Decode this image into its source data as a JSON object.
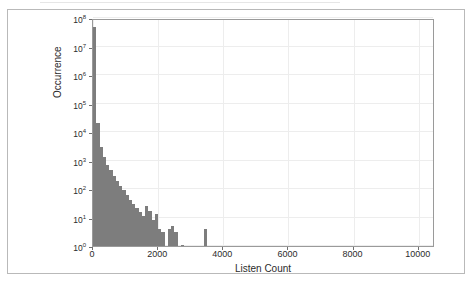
{
  "figure": {
    "background_color": "#ffffff",
    "frame_color": "#b9b9b9",
    "axis_color": "#9a9a9a",
    "grid_color": "#ededed",
    "bar_color": "#7d7d7d",
    "text_color": "#2b2b2b"
  },
  "chart_data": {
    "type": "bar",
    "title": "",
    "xlabel": "Listen Count",
    "ylabel": "Occurrence",
    "xlim": [
      0,
      10500
    ],
    "ylim": [
      1,
      100000000
    ],
    "yscale": "log",
    "xscale": "linear",
    "grid": true,
    "legend": null,
    "bin_width": 100,
    "xticks": [
      0,
      2000,
      4000,
      6000,
      8000,
      10000
    ],
    "xtick_labels": [
      "0",
      "2000",
      "4000",
      "6000",
      "8000",
      "10000"
    ],
    "yticks": [
      1,
      10,
      100,
      1000,
      10000,
      100000,
      1000000,
      10000000,
      100000000
    ],
    "ytick_labels": [
      "10⁰",
      "10¹",
      "10²",
      "10³",
      "10⁴",
      "10⁵",
      "10⁶",
      "10⁷",
      "10⁸"
    ],
    "ytick_mantissa": "10",
    "ytick_exponents": [
      "0",
      "1",
      "2",
      "3",
      "4",
      "5",
      "6",
      "7",
      "8"
    ],
    "x": [
      50,
      150,
      250,
      350,
      450,
      550,
      650,
      750,
      850,
      950,
      1050,
      1150,
      1250,
      1350,
      1450,
      1550,
      1650,
      1750,
      1850,
      1950,
      2050,
      2150,
      2350,
      2450,
      2550,
      2750,
      3450
    ],
    "values": [
      50000000,
      20000,
      3000,
      1300,
      700,
      450,
      280,
      190,
      130,
      90,
      60,
      42,
      30,
      22,
      16,
      11,
      26,
      17,
      8,
      13,
      4,
      3,
      4,
      5,
      3,
      1,
      4
    ]
  }
}
